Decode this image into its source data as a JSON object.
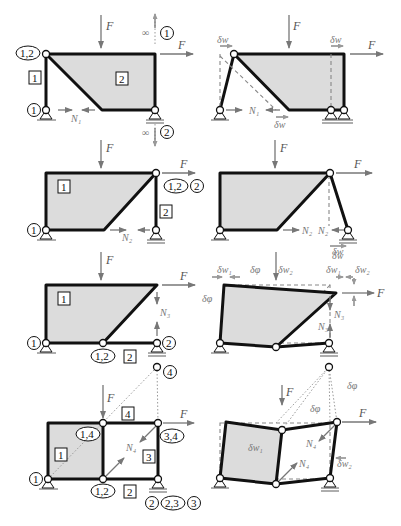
{
  "figure": {
    "type": "kinematic-chain-diagrams",
    "rows": 4,
    "columns": [
      "structure with pole labels",
      "virtual displacement state"
    ]
  },
  "labels": {
    "force": "F",
    "infinity": "∞",
    "N1": "N₁",
    "N2": "N₂",
    "N3": "N₃",
    "N4": "N₄",
    "dw": "δw",
    "dw1": "δw₁",
    "dw2": "δw₂",
    "dphi": "δφ"
  },
  "row1": {
    "poles": [
      "1,2",
      "1",
      "2",
      "2"
    ],
    "bodies": [
      "1",
      "2"
    ]
  },
  "row2": {
    "poles": [
      "1",
      "1,2",
      "2"
    ],
    "bodies": [
      "1",
      "2"
    ]
  },
  "row3": {
    "poles": [
      "1",
      "1,2",
      "2"
    ],
    "bodies": [
      "1",
      "2"
    ]
  },
  "row4": {
    "poles": [
      "4",
      "1,4",
      "3,4",
      "1",
      "1,2",
      "2",
      "2,3",
      "3"
    ],
    "bodies": [
      "1",
      "2",
      "3",
      "4"
    ]
  }
}
